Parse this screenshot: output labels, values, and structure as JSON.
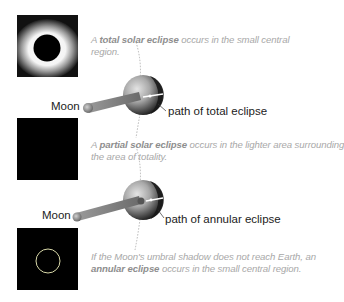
{
  "photos": [
    {
      "name": "total-eclipse-photo",
      "type": "total"
    },
    {
      "name": "partial-eclipse-photo",
      "type": "partial"
    },
    {
      "name": "annular-eclipse-photo",
      "type": "annular"
    }
  ],
  "captions": {
    "total": {
      "prefix": "A ",
      "bold": "total solar eclipse",
      "line1_rest": " occurs in the small central",
      "line2": "region."
    },
    "partial": {
      "prefix": "A ",
      "bold": "partial solar eclipse",
      "line1_rest": " occurs in the lighter area surrounding",
      "line2": "the area of totality."
    },
    "annular": {
      "line1": "If the Moon's umbral shadow does not reach Earth, an",
      "bold": "annular eclipse",
      "line2_rest": " occurs in the small central region."
    }
  },
  "diagram_top": {
    "moon_label": "Moon",
    "path_label": "path of total eclipse"
  },
  "diagram_bottom": {
    "moon_label": "Moon",
    "path_label": "path of annular eclipse"
  },
  "colors": {
    "caption_text": "#a8a8a8",
    "caption_bold": "#8e8e8e",
    "label_text": "#222222",
    "photo_bg": "#000000"
  }
}
